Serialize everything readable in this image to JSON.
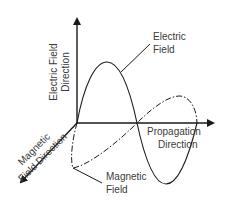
{
  "diagram": {
    "axes": {
      "vertical": {
        "line1": "Electric Field",
        "line2": "Direction"
      },
      "horizontal": {
        "line1": "Propagation",
        "line2": "Direction"
      },
      "diagonal": {
        "line1": "Magnetic",
        "line2": "Field Direction"
      }
    },
    "waves": {
      "electric": {
        "line1": "Electric",
        "line2": "Field",
        "style": "solid"
      },
      "magnetic": {
        "line1": "Magnetic",
        "line2": "Field",
        "style": "dash-dot"
      }
    },
    "colors": {
      "line": "#1a1a1a",
      "text": "#3a3a3a",
      "background": "#ffffff"
    }
  }
}
